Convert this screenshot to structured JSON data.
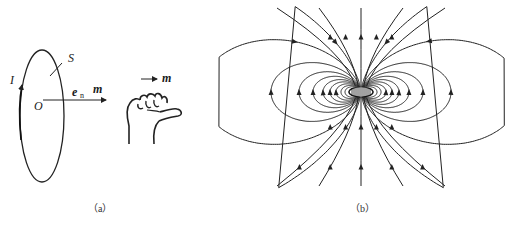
{
  "panel_a": {
    "caption": "（a）",
    "labels": {
      "current": "I",
      "surface": "S",
      "origin": "O",
      "normal_vector": "e",
      "normal_vector_sub": "n",
      "moment_main": "m",
      "moment_hand": "m"
    }
  },
  "panel_b": {
    "caption": "（b）",
    "description": "magnetic dipole field lines of a current loop"
  }
}
